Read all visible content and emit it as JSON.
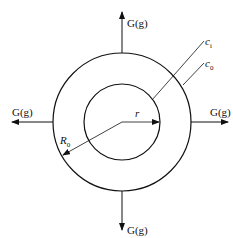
{
  "diagram": {
    "type": "concentric-circles-flux",
    "flux_labels": {
      "top": "G(g)",
      "bottom": "G(g)",
      "left": "G(g)",
      "right": "G(g)"
    },
    "concentration_labels": {
      "inner": "c",
      "inner_sub": "i",
      "outer": "c",
      "outer_sub": "0"
    },
    "radius_labels": {
      "inner": "r",
      "outer": "R",
      "outer_sub": "0"
    },
    "colors": {
      "stroke": "#111111",
      "background": "#ffffff"
    }
  }
}
